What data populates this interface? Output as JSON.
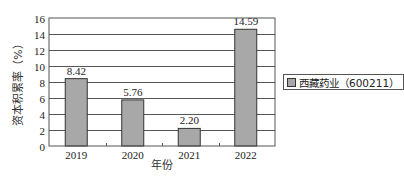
{
  "chart_data": {
    "type": "bar",
    "title": "",
    "categories": [
      "2019",
      "2020",
      "2021",
      "2022"
    ],
    "series": [
      {
        "name": "西藏药业（600211）",
        "values": [
          8.42,
          5.76,
          2.2,
          14.59
        ]
      }
    ],
    "value_labels": [
      "8.42",
      "5.76",
      "2.20",
      "14.59"
    ],
    "xlabel": "年份",
    "ylabel": "资本积累率（%）",
    "ylim": [
      0,
      16
    ],
    "yticks": [
      0,
      2,
      4,
      6,
      8,
      10,
      12,
      14,
      16
    ],
    "grid": true,
    "legend_position": "right",
    "colors": {
      "bar_fill": "#a8a8a8",
      "bar_border": "#333333",
      "grid": "#555555"
    }
  }
}
